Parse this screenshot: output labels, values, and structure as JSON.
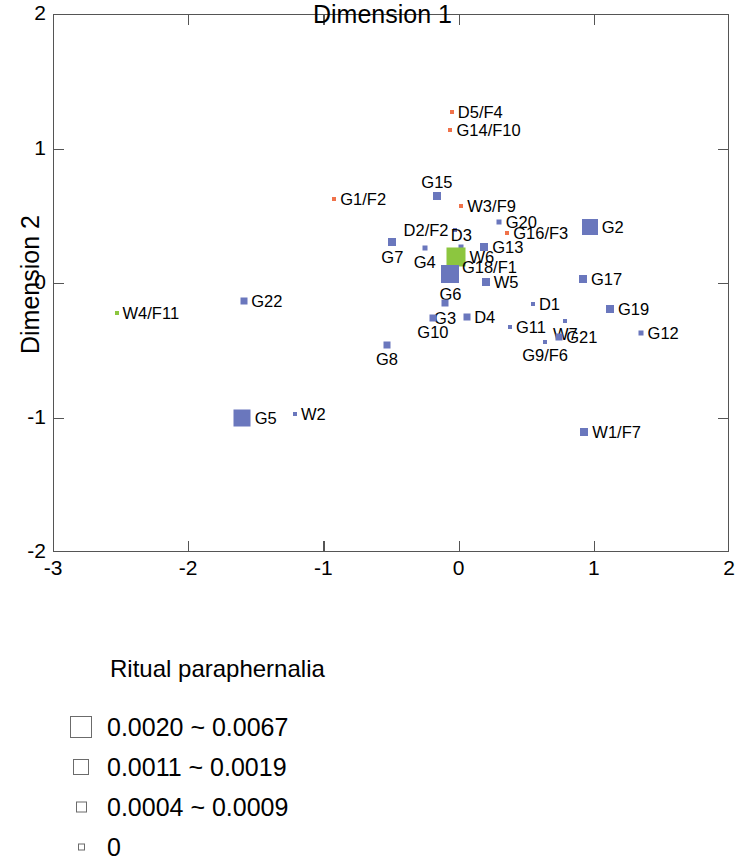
{
  "chart_data": {
    "type": "scatter",
    "title": "",
    "xlabel": "Dimension 1",
    "ylabel": "Dimension 2",
    "xlim": [
      -3,
      2
    ],
    "ylim": [
      -2,
      2
    ],
    "xticks": [
      -3,
      -2,
      -1,
      0,
      1,
      2
    ],
    "yticks": [
      -2,
      -1,
      0,
      1,
      2
    ],
    "xticklabels": [
      "-3",
      "-2",
      "-1",
      "0",
      "1",
      "2"
    ],
    "yticklabels": [
      "-2",
      "-1",
      "0",
      "1",
      "2"
    ],
    "grid": false,
    "legend_position": "below-plot",
    "colors": {
      "blue": "#6a77bd",
      "green": "#8cc63f",
      "orange": "#f0724a",
      "frame": "#555555"
    },
    "size_encoding": "marker area encodes Ritual paraphernalia proportion",
    "points": [
      {
        "label": "D5/F4",
        "x": -0.05,
        "y": 1.275,
        "size": 4,
        "color": "#f0724a",
        "label_pos": "right"
      },
      {
        "label": "G14/F10",
        "x": -0.06,
        "y": 1.135,
        "size": 4,
        "color": "#f0724a",
        "label_pos": "right"
      },
      {
        "label": "G15",
        "x": -0.16,
        "y": 0.645,
        "size": 8,
        "color": "#6a77bd",
        "label_pos": "above"
      },
      {
        "label": "G1/F2",
        "x": -0.92,
        "y": 0.625,
        "size": 4,
        "color": "#f0724a",
        "label_pos": "right"
      },
      {
        "label": "W3/F9",
        "x": 0.02,
        "y": 0.575,
        "size": 4,
        "color": "#f0724a",
        "label_pos": "right"
      },
      {
        "label": "G20",
        "x": 0.3,
        "y": 0.455,
        "size": 5,
        "color": "#6a77bd",
        "label_pos": "right"
      },
      {
        "label": "D2/F2",
        "x": -0.03,
        "y": 0.395,
        "size": 4,
        "color": "#6a77bd",
        "label_pos": "left"
      },
      {
        "label": "G16/F3",
        "x": 0.36,
        "y": 0.375,
        "size": 4,
        "color": "#f0724a",
        "label_pos": "right"
      },
      {
        "label": "G2",
        "x": 0.97,
        "y": 0.42,
        "size": 16,
        "color": "#6a77bd",
        "label_pos": "right"
      },
      {
        "label": "G7",
        "x": -0.49,
        "y": 0.305,
        "size": 8,
        "color": "#6a77bd",
        "label_pos": "below"
      },
      {
        "label": "G4",
        "x": -0.25,
        "y": 0.26,
        "size": 5,
        "color": "#6a77bd",
        "label_pos": "below"
      },
      {
        "label": "D3",
        "x": 0.02,
        "y": 0.265,
        "size": 5,
        "color": "#6a77bd",
        "label_pos": "above"
      },
      {
        "label": "G13",
        "x": 0.19,
        "y": 0.27,
        "size": 8,
        "color": "#6a77bd",
        "label_pos": "right"
      },
      {
        "label": "W6",
        "x": -0.02,
        "y": 0.19,
        "size": 19,
        "color": "#8cc63f",
        "label_pos": "right"
      },
      {
        "label": "G18/F1",
        "x": -0.02,
        "y": 0.12,
        "size": 4,
        "color": "#6a77bd",
        "label_pos": "right"
      },
      {
        "label": "G6",
        "x": -0.06,
        "y": 0.07,
        "size": 18,
        "color": "#6a77bd",
        "label_pos": "below"
      },
      {
        "label": "W5",
        "x": 0.2,
        "y": 0.01,
        "size": 8,
        "color": "#6a77bd",
        "label_pos": "right"
      },
      {
        "label": "G17",
        "x": 0.92,
        "y": 0.03,
        "size": 8,
        "color": "#6a77bd",
        "label_pos": "right"
      },
      {
        "label": "W4/F11",
        "x": -2.53,
        "y": -0.22,
        "size": 4,
        "color": "#8cc63f",
        "label_pos": "right"
      },
      {
        "label": "G22",
        "x": -1.59,
        "y": -0.135,
        "size": 7,
        "color": "#6a77bd",
        "label_pos": "right"
      },
      {
        "label": "G3",
        "x": -0.1,
        "y": -0.15,
        "size": 7,
        "color": "#6a77bd",
        "label_pos": "below"
      },
      {
        "label": "D1",
        "x": 0.55,
        "y": -0.155,
        "size": 4,
        "color": "#6a77bd",
        "label_pos": "right"
      },
      {
        "label": "G19",
        "x": 1.12,
        "y": -0.19,
        "size": 8,
        "color": "#6a77bd",
        "label_pos": "right"
      },
      {
        "label": "D4",
        "x": 0.06,
        "y": -0.255,
        "size": 7,
        "color": "#6a77bd",
        "label_pos": "right"
      },
      {
        "label": "G10",
        "x": -0.19,
        "y": -0.26,
        "size": 7,
        "color": "#6a77bd",
        "label_pos": "below"
      },
      {
        "label": "W7",
        "x": 0.79,
        "y": -0.285,
        "size": 4,
        "color": "#6a77bd",
        "label_pos": "below"
      },
      {
        "label": "G11",
        "x": 0.38,
        "y": -0.33,
        "size": 4,
        "color": "#6a77bd",
        "label_pos": "right"
      },
      {
        "label": "G12",
        "x": 1.35,
        "y": -0.37,
        "size": 5,
        "color": "#6a77bd",
        "label_pos": "right"
      },
      {
        "label": "G21",
        "x": 0.74,
        "y": -0.4,
        "size": 7,
        "color": "#6a77bd",
        "label_pos": "right"
      },
      {
        "label": "G9/F6",
        "x": 0.64,
        "y": -0.44,
        "size": 4,
        "color": "#6a77bd",
        "label_pos": "below"
      },
      {
        "label": "G8",
        "x": -0.53,
        "y": -0.46,
        "size": 7,
        "color": "#6a77bd",
        "label_pos": "below"
      },
      {
        "label": "G5",
        "x": -1.6,
        "y": -1.0,
        "size": 17,
        "color": "#6a77bd",
        "label_pos": "right"
      },
      {
        "label": "W2",
        "x": -1.21,
        "y": -0.975,
        "size": 4,
        "color": "#6a77bd",
        "label_pos": "right"
      },
      {
        "label": "W1/F7",
        "x": 0.93,
        "y": -1.11,
        "size": 8,
        "color": "#6a77bd",
        "label_pos": "right"
      }
    ]
  },
  "legend": {
    "title": "Ritual paraphernalia",
    "items": [
      {
        "label": "0.0020 ~ 0.0067",
        "swatch": 20
      },
      {
        "label": "0.0011 ~ 0.0019",
        "swatch": 14
      },
      {
        "label": "0.0004 ~ 0.0009",
        "swatch": 9
      },
      {
        "label": "0",
        "swatch": 5
      }
    ]
  }
}
